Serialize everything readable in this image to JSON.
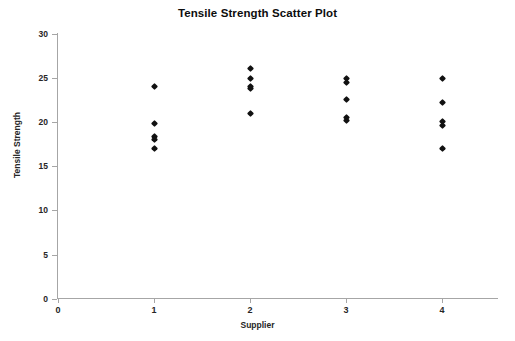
{
  "chart_data": {
    "type": "scatter",
    "title": "Tensile Strength Scatter Plot",
    "xlabel": "Supplier",
    "ylabel": "Tensile Strength",
    "xlim": [
      0,
      4.5
    ],
    "ylim": [
      0,
      30
    ],
    "grid": false,
    "legend": null,
    "x_ticks": [
      0,
      1,
      2,
      3,
      4
    ],
    "x_tick_labels": [
      "0",
      "1",
      "2",
      "3",
      "4"
    ],
    "y_ticks": [
      0,
      5,
      10,
      15,
      20,
      25,
      30
    ],
    "y_tick_labels": [
      "0",
      "5",
      "10",
      "15",
      "20",
      "25",
      "30"
    ],
    "marker": "diamond",
    "marker_color": "#111111",
    "points": [
      {
        "x": 1,
        "y": 24.0
      },
      {
        "x": 1,
        "y": 19.8
      },
      {
        "x": 1,
        "y": 18.4
      },
      {
        "x": 1,
        "y": 18.0
      },
      {
        "x": 1,
        "y": 17.0
      },
      {
        "x": 2,
        "y": 26.1
      },
      {
        "x": 2,
        "y": 25.0
      },
      {
        "x": 2,
        "y": 24.1
      },
      {
        "x": 2,
        "y": 23.8
      },
      {
        "x": 2,
        "y": 21.0
      },
      {
        "x": 3,
        "y": 24.9
      },
      {
        "x": 3,
        "y": 24.5
      },
      {
        "x": 3,
        "y": 22.6
      },
      {
        "x": 3,
        "y": 20.5
      },
      {
        "x": 3,
        "y": 20.2
      },
      {
        "x": 4,
        "y": 25.0
      },
      {
        "x": 4,
        "y": 22.2
      },
      {
        "x": 4,
        "y": 20.1
      },
      {
        "x": 4,
        "y": 19.6
      },
      {
        "x": 4,
        "y": 17.0
      }
    ]
  }
}
